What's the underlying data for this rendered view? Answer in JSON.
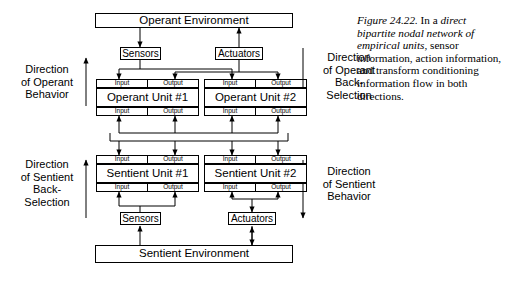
{
  "figure": {
    "caption_label": "Figure 24.22.",
    "caption_text_1": " In a ",
    "caption_italic_1": "direct bipartite nodal network of empirical units",
    "caption_text_2": ", sensor information, action information, and transform conditioning information flow in both directions."
  },
  "diagram": {
    "operant_environment": "Operant Environment",
    "sentient_environment": "Sentient Environment",
    "sensors_top": "Sensors",
    "actuators_top": "Actuators",
    "sensors_bottom": "Sensors",
    "actuators_bottom": "Actuators",
    "operant_unit_1": "Operant Unit #1",
    "operant_unit_2": "Operant Unit #2",
    "sentient_unit_1": "Sentient Unit #1",
    "sentient_unit_2": "Sentient Unit #2",
    "input_label": "Input",
    "output_label": "Output",
    "dir_operant_behavior": "Direction\nof Operant\nBehavior",
    "dir_operant_backselection": "Direction\nof Operant\nBack-\nSelection",
    "dir_sentient_backselection": "Direction\nof Sentient\nBack-\nSelection",
    "dir_sentient_behavior": "Direction\nof Sentient\nBehavior"
  },
  "colors": {
    "line": "#000000",
    "background": "#ffffff"
  }
}
